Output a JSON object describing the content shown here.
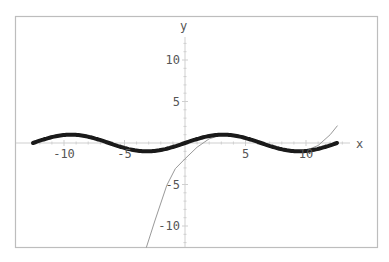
{
  "chart_data": {
    "type": "line",
    "title": "",
    "xlabel": "x",
    "ylabel": "y",
    "xlim": [
      -13.3,
      15.8
    ],
    "ylim": [
      -12.6,
      15.3
    ],
    "grid": false,
    "legend": null,
    "x_ticks": [
      -10,
      -5,
      5,
      10
    ],
    "x_tick_labels": [
      "-10",
      "-5",
      "5",
      "10"
    ],
    "y_ticks": [
      10,
      5,
      -5,
      -10
    ],
    "y_tick_labels": [
      "10",
      "5",
      "-5",
      "-10"
    ],
    "series": [
      {
        "name": "sin(x/2)",
        "style": "thick",
        "color": "#1a1a1a",
        "formula": "sin(x/2)",
        "x_range": [
          -12.566,
          12.566
        ],
        "points": [
          [
            -12.57,
            0
          ],
          [
            -11.0,
            0.71
          ],
          [
            -9.42,
            1.0
          ],
          [
            -7.85,
            0.71
          ],
          [
            -6.28,
            0
          ],
          [
            -4.71,
            -0.71
          ],
          [
            -3.14,
            -1.0
          ],
          [
            -1.57,
            -0.71
          ],
          [
            0,
            0
          ],
          [
            1.57,
            0.71
          ],
          [
            3.14,
            1.0
          ],
          [
            4.71,
            0.71
          ],
          [
            6.28,
            0
          ],
          [
            7.85,
            -0.71
          ],
          [
            9.42,
            -1.0
          ],
          [
            11.0,
            -0.71
          ],
          [
            12.57,
            0
          ]
        ]
      },
      {
        "name": "approximation",
        "style": "thin",
        "color": "#999999",
        "points": [
          [
            -3.2,
            -12.6
          ],
          [
            -2.5,
            -9.4
          ],
          [
            -1.5,
            -5.1
          ],
          [
            -0.8,
            -3.1
          ],
          [
            0,
            -1.9
          ],
          [
            1,
            -0.5
          ],
          [
            2,
            0.5
          ],
          [
            3,
            0.95
          ],
          [
            4,
            0.9
          ],
          [
            5,
            0.6
          ],
          [
            6,
            0.1
          ],
          [
            7,
            -0.4
          ],
          [
            8,
            -0.8
          ],
          [
            9,
            -1.0
          ],
          [
            10,
            -0.9
          ],
          [
            11,
            -0.3
          ],
          [
            12,
            1.0
          ],
          [
            12.6,
            2.1
          ]
        ]
      }
    ]
  }
}
